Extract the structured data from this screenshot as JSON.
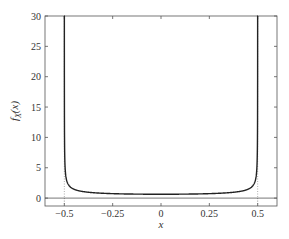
{
  "chart_data": {
    "type": "line",
    "title": "",
    "xlabel": "x",
    "ylabel": "f_X(x)",
    "xlim": [
      -0.6,
      0.6
    ],
    "ylim": [
      -1.3,
      30
    ],
    "grid": false,
    "legend": null,
    "x_ticks": [
      -0.5,
      -0.25,
      0,
      0.25,
      0.5
    ],
    "x_tick_labels": [
      "−0.5",
      "−0.25",
      "0",
      "0.25",
      "0.5"
    ],
    "y_ticks": [
      0,
      5,
      10,
      15,
      20,
      25,
      30
    ],
    "y_tick_labels": [
      "0",
      "5",
      "10",
      "15",
      "20",
      "25",
      "30"
    ],
    "series": [
      {
        "name": "f_X(x) = 1 / (π √(0.25 − x²))",
        "style": "solid",
        "color": "#222222",
        "x": [
          -0.4999,
          -0.499,
          -0.495,
          -0.49,
          -0.48,
          -0.45,
          -0.4,
          -0.3,
          -0.2,
          -0.1,
          0,
          0.1,
          0.2,
          0.3,
          0.4,
          0.45,
          0.48,
          0.49,
          0.495,
          0.499,
          0.4999
        ],
        "y": [
          31.8,
          10.07,
          4.51,
          3.2,
          2.27,
          1.46,
          1.06,
          0.8,
          0.69,
          0.65,
          0.637,
          0.65,
          0.69,
          0.8,
          1.06,
          1.46,
          2.27,
          3.2,
          4.51,
          10.07,
          31.8
        ]
      }
    ],
    "annotations": [
      {
        "type": "vline",
        "x": -0.5,
        "style": "dotted"
      },
      {
        "type": "vline",
        "x": 0.5,
        "style": "dotted"
      },
      {
        "type": "hline",
        "y": 0,
        "style": "solid"
      }
    ]
  },
  "labels": {
    "x_axis": "x",
    "y_axis_main": "f",
    "y_axis_sub": "X",
    "y_axis_arg": "(x)"
  },
  "colors": {
    "curve": "#222222",
    "axes": "#555555",
    "dotted": "#777777"
  }
}
